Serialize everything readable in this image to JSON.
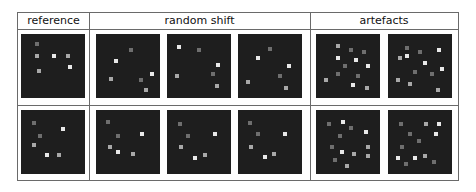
{
  "headers": {
    "reference": "reference",
    "random_shift": "random shift",
    "artefacts": "artefacts"
  },
  "colors": {
    "panel_bg": "#1e1e1e",
    "border": "#6a6a6a",
    "dot_bright": "#e8e8e8",
    "dot_mid": "#a8a8a8",
    "dot_dim": "#6e6e6e"
  },
  "rows": [
    {
      "panels": [
        {
          "group": "reference",
          "dots": [
            [
              25,
              15,
              "dim"
            ],
            [
              25,
              35,
              "mid"
            ],
            [
              52,
              35,
              "bright"
            ],
            [
              73,
              35,
              "mid"
            ],
            [
              76,
              52,
              "bright"
            ],
            [
              28,
              58,
              "mid"
            ]
          ]
        },
        {
          "group": "random shift",
          "dots": [
            [
              55,
              25,
              "dim"
            ],
            [
              32,
              42,
              "bright"
            ],
            [
              87,
              62,
              "bright"
            ],
            [
              23,
              70,
              "mid"
            ],
            [
              70,
              72,
              "dim"
            ],
            [
              78,
              88,
              "mid"
            ]
          ]
        },
        {
          "group": "random shift",
          "dots": [
            [
              18,
              20,
              "bright"
            ],
            [
              50,
              25,
              "dim"
            ],
            [
              80,
              48,
              "bright"
            ],
            [
              15,
              65,
              "mid"
            ],
            [
              72,
              62,
              "dim"
            ],
            [
              78,
              82,
              "mid"
            ]
          ]
        },
        {
          "group": "random shift",
          "dots": [
            [
              50,
              23,
              "dim"
            ],
            [
              31,
              38,
              "bright"
            ],
            [
              80,
              50,
              "bright"
            ],
            [
              15,
              75,
              "mid"
            ],
            [
              65,
              65,
              "dim"
            ],
            [
              75,
              85,
              "mid"
            ]
          ]
        }
      ]
    },
    {
      "panels": [
        {
          "group": "reference",
          "dots": [
            [
              20,
              20,
              "dim"
            ],
            [
              65,
              30,
              "bright"
            ],
            [
              30,
              40,
              "dim"
            ],
            [
              20,
              55,
              "mid"
            ],
            [
              40,
              70,
              "bright"
            ],
            [
              60,
              70,
              "mid"
            ]
          ]
        },
        {
          "group": "random shift",
          "dots": [
            [
              18,
              18,
              "dim"
            ],
            [
              72,
              38,
              "bright"
            ],
            [
              35,
              40,
              "dim"
            ],
            [
              22,
              58,
              "mid"
            ],
            [
              35,
              65,
              "bright"
            ],
            [
              58,
              68,
              "mid"
            ]
          ]
        },
        {
          "group": "random shift",
          "dots": [
            [
              20,
              22,
              "dim"
            ],
            [
              75,
              38,
              "bright"
            ],
            [
              33,
              40,
              "dim"
            ],
            [
              22,
              58,
              "mid"
            ],
            [
              43,
              75,
              "bright"
            ],
            [
              60,
              70,
              "mid"
            ]
          ]
        },
        {
          "group": "random shift",
          "dots": [
            [
              18,
              20,
              "dim"
            ],
            [
              73,
              38,
              "bright"
            ],
            [
              32,
              38,
              "dim"
            ],
            [
              20,
              58,
              "mid"
            ],
            [
              42,
              73,
              "bright"
            ],
            [
              56,
              68,
              "mid"
            ]
          ]
        }
      ]
    }
  ],
  "artefact_panels": [
    [
      {
        "dots": [
          [
            35,
            18,
            "mid"
          ],
          [
            55,
            25,
            "dim"
          ],
          [
            75,
            28,
            "dim"
          ],
          [
            35,
            38,
            "bright"
          ],
          [
            63,
            40,
            "bright"
          ],
          [
            45,
            50,
            "dim"
          ],
          [
            82,
            50,
            "bright"
          ],
          [
            15,
            72,
            "mid"
          ],
          [
            35,
            62,
            "dim"
          ],
          [
            65,
            65,
            "dim"
          ],
          [
            58,
            80,
            "bright"
          ],
          [
            80,
            85,
            "mid"
          ]
        ]
      },
      {
        "dots": [
          [
            30,
            22,
            "dim"
          ],
          [
            50,
            28,
            "dim"
          ],
          [
            80,
            25,
            "bright"
          ],
          [
            18,
            38,
            "mid"
          ],
          [
            30,
            35,
            "bright"
          ],
          [
            58,
            45,
            "bright"
          ],
          [
            42,
            60,
            "dim"
          ],
          [
            68,
            62,
            "dim"
          ],
          [
            85,
            55,
            "bright"
          ],
          [
            15,
            72,
            "mid"
          ],
          [
            35,
            78,
            "mid"
          ],
          [
            78,
            88,
            "mid"
          ]
        ]
      }
    ],
    [
      {
        "dots": [
          [
            20,
            22,
            "dim"
          ],
          [
            42,
            18,
            "bright"
          ],
          [
            55,
            28,
            "dim"
          ],
          [
            38,
            40,
            "dim"
          ],
          [
            78,
            35,
            "bright"
          ],
          [
            25,
            58,
            "dim"
          ],
          [
            40,
            65,
            "bright"
          ],
          [
            60,
            68,
            "mid"
          ],
          [
            82,
            58,
            "mid"
          ],
          [
            30,
            78,
            "dim"
          ],
          [
            82,
            72,
            "mid"
          ],
          [
            48,
            88,
            "mid"
          ]
        ]
      },
      {
        "dots": [
          [
            20,
            22,
            "dim"
          ],
          [
            60,
            22,
            "mid"
          ],
          [
            80,
            22,
            "bright"
          ],
          [
            35,
            38,
            "dim"
          ],
          [
            75,
            38,
            "bright"
          ],
          [
            48,
            48,
            "dim"
          ],
          [
            22,
            58,
            "dim"
          ],
          [
            15,
            75,
            "bright"
          ],
          [
            42,
            75,
            "bright"
          ],
          [
            58,
            72,
            "mid"
          ],
          [
            28,
            85,
            "dim"
          ],
          [
            72,
            82,
            "dim"
          ]
        ]
      }
    ]
  ]
}
